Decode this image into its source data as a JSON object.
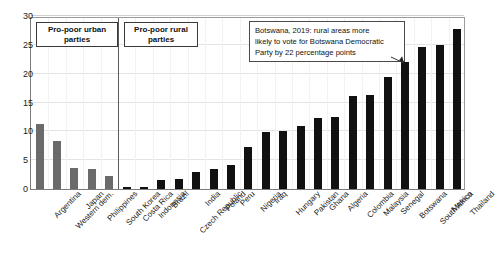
{
  "chart_data": {
    "type": "bar",
    "title": "",
    "subtitle": "",
    "xlabel": "",
    "ylabel": "",
    "ylim": [
      0,
      30
    ],
    "ytick_values": [
      0,
      5,
      10,
      15,
      20,
      25,
      30
    ],
    "ytick_labels": [
      "0",
      "5",
      "10",
      "15",
      "20",
      "25",
      "30"
    ],
    "grid": true,
    "legend_position": "none",
    "categories": [
      "Argentina",
      "Western dem.",
      "Japan",
      "Philippines",
      "South Korea",
      "Costa Rica",
      "Indonesia",
      "Brazil",
      "Czech Republic",
      "India",
      "Poland",
      "Peru",
      "Nigeria",
      "Iraq",
      "Hungary",
      "Pakistan",
      "Ghana",
      "Algeria",
      "Colombia",
      "Malaysia",
      "Senegal",
      "Botswana",
      "South Africa",
      "Mexico",
      "Thailand"
    ],
    "values": [
      11.2,
      8.3,
      3.7,
      3.4,
      2.3,
      0.35,
      0.3,
      1.6,
      1.7,
      3.0,
      3.5,
      4.2,
      7.3,
      9.9,
      10.1,
      11.0,
      12.3,
      12.5,
      16.2,
      16.3,
      19.4,
      22.0,
      24.7,
      24.9,
      27.7
    ],
    "bar_colors": [
      "#6b6b6b",
      "#6b6b6b",
      "#6b6b6b",
      "#6b6b6b",
      "#6b6b6b",
      "#111111",
      "#111111",
      "#111111",
      "#111111",
      "#111111",
      "#111111",
      "#111111",
      "#111111",
      "#111111",
      "#111111",
      "#111111",
      "#111111",
      "#111111",
      "#111111",
      "#111111",
      "#111111",
      "#111111",
      "#111111",
      "#111111",
      "#111111"
    ],
    "groups": [
      {
        "label": "Pro-poor urban\nparties",
        "start_index": 0,
        "end_index": 4,
        "bar_color": "#6b6b6b"
      },
      {
        "label": "Pro-poor rural\nparties",
        "start_index": 5,
        "end_index": 24,
        "bar_color": "#111111"
      }
    ],
    "separators_after_index": [
      4
    ],
    "annotations": [
      {
        "text": "Botswana, 2019: rural areas more\nlikely to vote for Botswana Democratic\nParty by 22 percentage points",
        "target_category": "Botswana",
        "target_value": 22.0
      }
    ],
    "colors": {
      "urban_bar": "#6b6b6b",
      "rural_bar": "#111111",
      "grid": "#e4e4e4",
      "axis": "#7b7b7b",
      "text": "#1a1a1a",
      "background": "#ffffff"
    }
  }
}
